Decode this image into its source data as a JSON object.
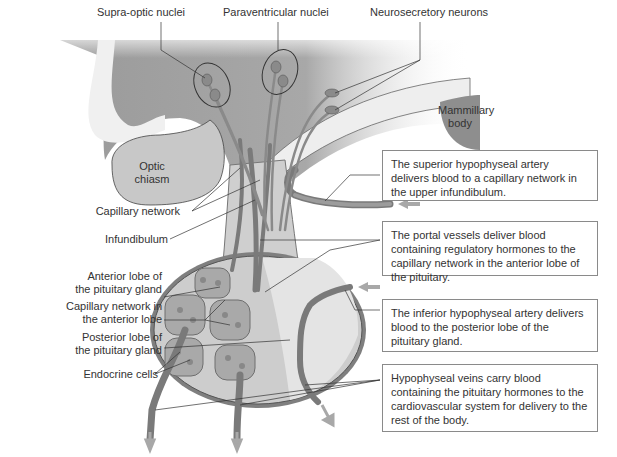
{
  "top_labels": {
    "supra_optic": "Supra-optic nuclei",
    "paraventricular": "Paraventricular nuclei",
    "neurosecretory": "Neurosecretory neurons"
  },
  "structures": {
    "mammillary": "Mammillary body",
    "optic_chiasm": "Optic chiasm"
  },
  "left_labels": {
    "capillary_network": "Capillary network",
    "infundibulum": "Infundibulum",
    "anterior_lobe": [
      "Anterior lobe of",
      "the pituitary gland"
    ],
    "capillary_anterior": [
      "Capillary network in",
      "the anterior lobe"
    ],
    "posterior_lobe": [
      "Posterior lobe of",
      "the pituitary gland"
    ],
    "endocrine": "Endocrine cells"
  },
  "callouts": [
    {
      "text": "The superior hypophyseal artery delivers blood to a capillary network in the upper infundibulum."
    },
    {
      "text": "The portal vessels deliver blood containing regulatory hormones to the capillary network in the anterior lobe of the pituitary."
    },
    {
      "text": "The inferior hypophyseal artery delivers blood to the posterior lobe of the pituitary gland."
    },
    {
      "text": "Hypophyseal veins carry blood containing the pituitary hormones to the cardiovascular system for delivery to the rest of the body."
    }
  ],
  "colors": {
    "tissue_dark": "#8c8c8c",
    "tissue_light": "#d9d9d9",
    "vessel": "#7a7a7a",
    "arrow": "#a8a8a8",
    "box_border": "#8a8a8a"
  }
}
